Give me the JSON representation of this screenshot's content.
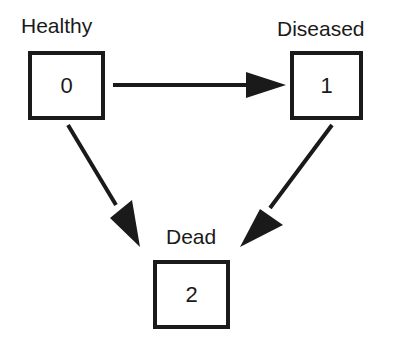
{
  "diagram": {
    "type": "state-transition",
    "nodes": [
      {
        "id": "0",
        "label": "Healthy",
        "value": "0"
      },
      {
        "id": "1",
        "label": "Diseased",
        "value": "1"
      },
      {
        "id": "2",
        "label": "Dead",
        "value": "2"
      }
    ],
    "edges": [
      {
        "from": "0",
        "to": "1"
      },
      {
        "from": "0",
        "to": "2"
      },
      {
        "from": "1",
        "to": "2"
      }
    ]
  }
}
